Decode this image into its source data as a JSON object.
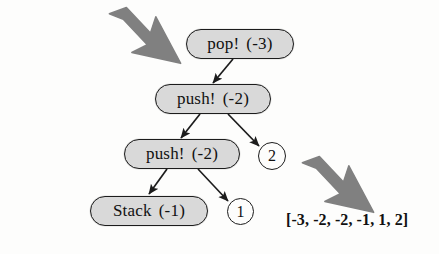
{
  "diagram": {
    "background_color": "#fdfdfc",
    "node_fill_color": "#d9d9d9",
    "node_stroke_color": "#1c1c1c",
    "arrow_color": "#808080",
    "edge_color": "#1c1c1c",
    "nodes": [
      {
        "id": "pop-3",
        "label": "pop!",
        "arg": "(-3)",
        "shape": "rounded-rect",
        "x": 186,
        "y": 29,
        "w": 108,
        "h": 30
      },
      {
        "id": "push-2-a",
        "label": "push!",
        "arg": "(-2)",
        "shape": "rounded-rect",
        "x": 155,
        "y": 84,
        "w": 116,
        "h": 30
      },
      {
        "id": "push-2-b",
        "label": "push!",
        "arg": "(-2)",
        "shape": "rounded-rect",
        "x": 124,
        "y": 139,
        "w": 116,
        "h": 30
      },
      {
        "id": "stack-1",
        "label": "Stack",
        "arg": "(-1)",
        "shape": "rounded-rect",
        "x": 90,
        "y": 196,
        "w": 118,
        "h": 30
      }
    ],
    "leaves": [
      {
        "id": "leaf-2",
        "value": "2",
        "shape": "circle",
        "x": 258,
        "y": 142,
        "d": 28
      },
      {
        "id": "leaf-1",
        "value": "1",
        "shape": "circle",
        "x": 227,
        "y": 198,
        "d": 27
      }
    ],
    "edges": [
      {
        "id": "edge-pop-to-push-a",
        "from": "pop-3",
        "to": "push-2-a",
        "x1": 233,
        "y1": 59,
        "x2": 213,
        "y2": 83
      },
      {
        "id": "edge-push-a-to-push-b",
        "from": "push-2-a",
        "to": "push-2-b",
        "x1": 200,
        "y1": 114,
        "x2": 181,
        "y2": 138
      },
      {
        "id": "edge-push-a-to-leaf-2",
        "from": "push-2-a",
        "to": "leaf-2",
        "x1": 228,
        "y1": 114,
        "x2": 259,
        "y2": 146
      },
      {
        "id": "edge-push-b-to-stack",
        "from": "push-2-b",
        "to": "stack-1",
        "x1": 167,
        "y1": 169,
        "x2": 149,
        "y2": 194
      },
      {
        "id": "edge-push-b-to-leaf-1",
        "from": "push-2-b",
        "to": "leaf-1",
        "x1": 198,
        "y1": 169,
        "x2": 228,
        "y2": 201
      }
    ],
    "annotations": [
      {
        "id": "pointer-top-left",
        "kind": "bolt-arrow",
        "direction": "down-right",
        "x": 106,
        "y": 6,
        "w": 78,
        "h": 62
      },
      {
        "id": "pointer-bottom-right",
        "kind": "bolt-arrow",
        "direction": "down-right",
        "x": 299,
        "y": 155,
        "w": 78,
        "h": 62
      }
    ],
    "result": {
      "id": "result-list",
      "text": "[-3, -2, -2, -1, 1, 2]",
      "x": 286,
      "y": 211
    }
  }
}
